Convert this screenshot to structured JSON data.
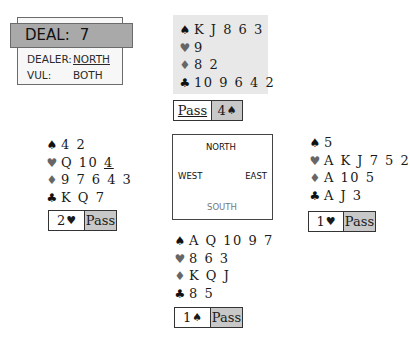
{
  "deal": {
    "title_label": "DEAL:",
    "number": "7",
    "dealer_label": "DEALER:",
    "dealer_value": "NORTH",
    "vul_label": "VUL:",
    "vul_value": "BOTH"
  },
  "suits": {
    "spade": "♠",
    "heart": "♥",
    "diamond": "♦",
    "club": "♣"
  },
  "hands": {
    "north": {
      "spades": "K J 8 6 3",
      "hearts": "9",
      "diamonds": "8 2",
      "clubs": "10 9 6 4 2"
    },
    "west": {
      "spades": "4 2",
      "hearts_main": "Q 10 ",
      "hearts_underlined": "4",
      "diamonds": "9 7 6 4 3",
      "clubs": "K Q 7"
    },
    "east": {
      "spades": "5",
      "hearts": "A K J 7 5 2",
      "diamonds": "A 10 5",
      "clubs": "A J 3"
    },
    "south": {
      "spades": "A Q 10 9 7",
      "hearts": "8 6 3",
      "diamonds": "K Q J",
      "clubs": "8 5"
    }
  },
  "bids": {
    "north": {
      "first": "Pass",
      "second_level": "4",
      "second_suit": "♠"
    },
    "west": {
      "first_level": "2",
      "first_suit": "♥",
      "second": "Pass"
    },
    "east": {
      "first_level": "1",
      "first_suit": "♥",
      "second": "Pass"
    },
    "south": {
      "first_level": "1",
      "first_suit": "♠",
      "second": "Pass"
    }
  },
  "compass": {
    "north": "NORTH",
    "west": "WEST",
    "east": "EAST",
    "south": "SOUTH"
  },
  "colors": {
    "black_suit": "#111111",
    "red_suit": "#666666",
    "north_bg": "#e8e8e8",
    "bid_highlight": "#c8c8c8",
    "deal_header": "#a9a9a9"
  }
}
